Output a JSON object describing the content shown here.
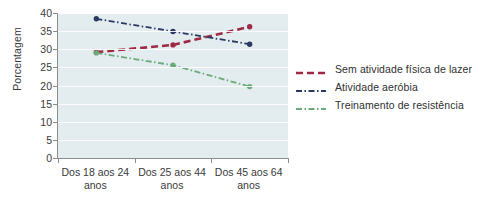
{
  "chart_data": {
    "type": "line",
    "title": "",
    "xlabel": "",
    "ylabel": "Porcentagem",
    "ylim": [
      0,
      40
    ],
    "ytick_step": 5,
    "yticks": [
      40,
      35,
      30,
      25,
      20,
      15,
      10,
      5,
      0
    ],
    "grid": true,
    "legend_position": "right",
    "categories": [
      "Dos 18 aos 24 anos",
      "Dos 25 aos 44 anos",
      "Dos 45 aos 64 anos"
    ],
    "category_lines": [
      [
        "Dos 18 aos 24",
        "anos"
      ],
      [
        "Dos 25 aos 44",
        "anos"
      ],
      [
        "Dos 45 aos 64",
        "anos"
      ]
    ],
    "series": [
      {
        "name": "Sem atividade física de lazer",
        "values": [
          29.2,
          31.2,
          36.2
        ],
        "color": "#9e2945",
        "dash": "dashed",
        "marker": true
      },
      {
        "name": "Atividade aeróbia",
        "values": [
          38.4,
          34.9,
          31.4
        ],
        "color": "#2b3a62",
        "dash": "dash-dot",
        "marker": true
      },
      {
        "name": "Treinamento de resistência",
        "values": [
          29.0,
          25.6,
          19.7
        ],
        "color": "#6aab7c",
        "dash": "dash-dot",
        "marker": true
      }
    ]
  },
  "colors": {
    "plot_background": "#e3ecee",
    "gridline": "#ffffff",
    "axis": "#8d8d8d",
    "text": "#3a3a3a",
    "series_no_leisure_activity": "#9e2945",
    "series_aerobic": "#2b3a62",
    "series_resistance": "#6aab7c"
  }
}
